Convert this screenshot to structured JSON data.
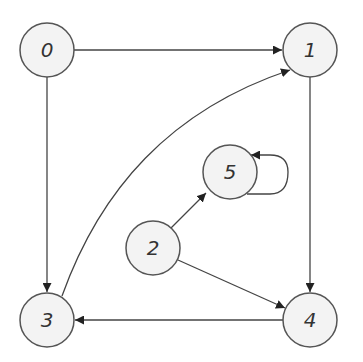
{
  "graph": {
    "type": "directed",
    "nodes": [
      {
        "id": "0",
        "label": "0",
        "x": 47,
        "y": 50
      },
      {
        "id": "1",
        "label": "1",
        "x": 310,
        "y": 50
      },
      {
        "id": "2",
        "label": "2",
        "x": 153,
        "y": 248
      },
      {
        "id": "3",
        "label": "3",
        "x": 47,
        "y": 320
      },
      {
        "id": "4",
        "label": "4",
        "x": 310,
        "y": 320
      },
      {
        "id": "5",
        "label": "5",
        "x": 230,
        "y": 172
      }
    ],
    "edges": [
      {
        "from": "0",
        "to": "1"
      },
      {
        "from": "0",
        "to": "3"
      },
      {
        "from": "3",
        "to": "1",
        "curved": true
      },
      {
        "from": "1",
        "to": "4"
      },
      {
        "from": "2",
        "to": "5"
      },
      {
        "from": "2",
        "to": "4"
      },
      {
        "from": "4",
        "to": "3"
      },
      {
        "from": "5",
        "to": "5",
        "self_loop": true
      }
    ],
    "colors": {
      "node_fill": "#f3f3f3",
      "node_stroke": "#555555",
      "edge": "#444444"
    }
  }
}
